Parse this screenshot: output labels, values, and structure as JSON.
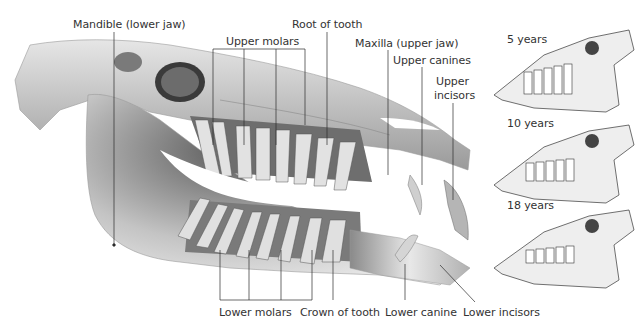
{
  "diagram": {
    "main_labels": {
      "mandible": "Mandible (lower jaw)",
      "upper_molars": "Upper molars",
      "root_of_tooth": "Root of tooth",
      "maxilla": "Maxilla (upper jaw)",
      "upper_canines": "Upper canines",
      "upper_incisors_line1": "Upper",
      "upper_incisors_line2": "incisors",
      "lower_molars": "Lower molars",
      "crown_of_tooth": "Crown of tooth",
      "lower_canine": "Lower canine",
      "lower_incisors": "Lower incisors"
    },
    "age_panels": [
      {
        "label": "5 years"
      },
      {
        "label": "10 years"
      },
      {
        "label": "18 years"
      }
    ],
    "colors": {
      "bone_light": "#f2f2f2",
      "bone_mid": "#bdbdbd",
      "bone_dark": "#5a5a5a",
      "leader_line": "#2b2b2b",
      "text": "#333333"
    }
  }
}
